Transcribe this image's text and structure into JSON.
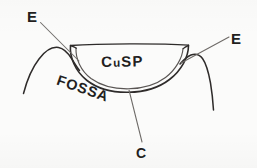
{
  "figure": {
    "style": "hand-drawn pen line drawing",
    "background_color": "#fbfbfa",
    "ink_color": "#2e2b2a",
    "leader_color": "#6e6a67",
    "width": 257,
    "height": 168
  },
  "labels": {
    "cusp": "Cusp",
    "cusp_first_letter": "C",
    "cusp_small_caps": "u",
    "cusp_last_letters": "SP",
    "fossa": "FOSSA",
    "e_left": "E",
    "e_right": "E",
    "c_bottom": "C"
  },
  "annotations": [
    {
      "name": "e-left",
      "label": "E",
      "leader_from": [
        40,
        22
      ],
      "leader_to": [
        79,
        61
      ],
      "points_at": "left cusp incline / ridge"
    },
    {
      "name": "e-right",
      "label": "E",
      "leader_from": [
        229,
        37
      ],
      "leader_to": [
        181,
        63
      ],
      "points_at": "right cusp incline / ridge"
    },
    {
      "name": "c-bottom",
      "label": "C",
      "leader_from": [
        129,
        90
      ],
      "leader_to": [
        142,
        142
      ],
      "points_at": "central fossa depth / bowl base"
    }
  ],
  "shapes": {
    "bowl_top_rim": "near-horizontal line across the top of the cusp bowl",
    "bowl_outer_arc": "wide U-shaped arc forming the cusp outline",
    "bowl_inner_arc": "second parallel arc just inside the outer arc",
    "left_adjacent_cusp": "rising then falling curve to the left of the bowl",
    "right_adjacent_cusp": "rising then falling curve to the right of the bowl"
  }
}
